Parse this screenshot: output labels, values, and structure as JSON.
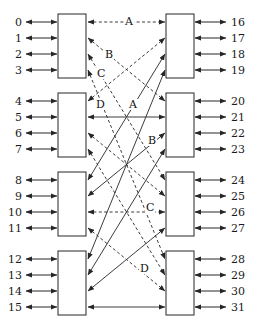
{
  "diagram": {
    "type": "switching-network",
    "stroke_color": "#262626",
    "box_fill": "#ffffff",
    "label_color": "#1a1a1a"
  },
  "input_ports": [
    {
      "label": "0"
    },
    {
      "label": "1"
    },
    {
      "label": "2"
    },
    {
      "label": "3"
    },
    {
      "label": "4"
    },
    {
      "label": "5"
    },
    {
      "label": "6"
    },
    {
      "label": "7"
    },
    {
      "label": "8"
    },
    {
      "label": "9"
    },
    {
      "label": "10"
    },
    {
      "label": "11"
    },
    {
      "label": "12"
    },
    {
      "label": "13"
    },
    {
      "label": "14"
    },
    {
      "label": "15"
    }
  ],
  "output_ports": [
    {
      "label": "16"
    },
    {
      "label": "17"
    },
    {
      "label": "18"
    },
    {
      "label": "19"
    },
    {
      "label": "20"
    },
    {
      "label": "21"
    },
    {
      "label": "22"
    },
    {
      "label": "23"
    },
    {
      "label": "24"
    },
    {
      "label": "25"
    },
    {
      "label": "26"
    },
    {
      "label": "27"
    },
    {
      "label": "28"
    },
    {
      "label": "29"
    },
    {
      "label": "30"
    },
    {
      "label": "31"
    }
  ],
  "left_switches": [
    {
      "id": "L0",
      "ports": [
        "0",
        "1",
        "2",
        "3"
      ]
    },
    {
      "id": "L1",
      "ports": [
        "4",
        "5",
        "6",
        "7"
      ]
    },
    {
      "id": "L2",
      "ports": [
        "8",
        "9",
        "10",
        "11"
      ]
    },
    {
      "id": "L3",
      "ports": [
        "12",
        "13",
        "14",
        "15"
      ]
    }
  ],
  "right_switches": [
    {
      "id": "R0",
      "ports": [
        "16",
        "17",
        "18",
        "19"
      ]
    },
    {
      "id": "R1",
      "ports": [
        "20",
        "21",
        "22",
        "23"
      ]
    },
    {
      "id": "R2",
      "ports": [
        "24",
        "25",
        "26",
        "27"
      ]
    },
    {
      "id": "R3",
      "ports": [
        "28",
        "29",
        "30",
        "31"
      ]
    }
  ],
  "link_labels": [
    {
      "text": "A",
      "x": 124,
      "y": 28,
      "group": "A",
      "stage": "L0"
    },
    {
      "text": "B",
      "x": 107,
      "y": 58,
      "group": "B",
      "stage": "L0"
    },
    {
      "text": "C",
      "x": 100,
      "y": 78,
      "group": "C",
      "stage": "L0"
    },
    {
      "text": "D",
      "x": 98,
      "y": 106,
      "group": "D",
      "stage": "L0"
    },
    {
      "text": "A",
      "x": 131,
      "y": 106,
      "group": "A",
      "stage": "L1"
    },
    {
      "text": "B",
      "x": 150,
      "y": 141,
      "group": "B",
      "stage": "L1"
    },
    {
      "text": "C",
      "x": 148,
      "y": 208,
      "group": "C",
      "stage": "L2"
    },
    {
      "text": "D",
      "x": 142,
      "y": 268,
      "group": "D",
      "stage": "L3"
    }
  ],
  "legend_note": {
    "groups": [
      "A",
      "B",
      "C",
      "D"
    ],
    "description": "Each left switch connects to all four right switches via link groups A, B, C and D"
  }
}
